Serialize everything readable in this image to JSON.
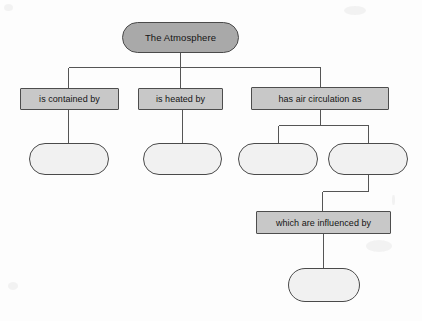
{
  "diagram": {
    "title_node": {
      "label": "The Atmosphere",
      "shape": "rounded-pill",
      "fill": "#a9a9a9",
      "stroke": "#4a4a4a"
    },
    "branch_labels": [
      {
        "label": "is contained by"
      },
      {
        "label": "is heated by"
      },
      {
        "label": "has air circulation as"
      },
      {
        "label": "which are influenced by"
      }
    ],
    "blank_nodes": [
      {
        "label": ""
      },
      {
        "label": ""
      },
      {
        "label": ""
      },
      {
        "label": ""
      },
      {
        "label": ""
      }
    ],
    "colors": {
      "background": "#fdfdfd",
      "label_fill": "#c8c8c8",
      "blank_fill": "#f1f1f1",
      "line": "#555555",
      "text": "#141414"
    }
  }
}
